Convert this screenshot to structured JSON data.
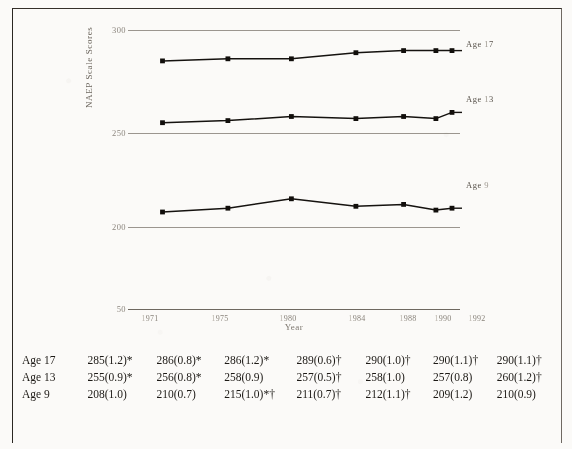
{
  "chart_data": {
    "type": "line",
    "title": "",
    "xlabel": "Year",
    "ylabel": "NAEP Scale Scores",
    "x": [
      "1971",
      "1975",
      "1980",
      "1984",
      "1988",
      "1990",
      "1992"
    ],
    "ylim": [
      50,
      300
    ],
    "yticks": [
      "300",
      "250",
      "200",
      "50"
    ],
    "grid": true,
    "legend_position": "right-inline",
    "series": [
      {
        "name": "Age 17",
        "values": [
          285,
          286,
          286,
          289,
          290,
          290,
          290
        ]
      },
      {
        "name": "Age 13",
        "values": [
          255,
          256,
          258,
          257,
          258,
          257,
          260
        ]
      },
      {
        "name": "Age 9",
        "values": [
          208,
          210,
          215,
          211,
          212,
          209,
          210
        ]
      }
    ]
  },
  "axis": {
    "y_title": "NAEP Scale Scores",
    "x_title": "Year",
    "y_ticks": [
      "300",
      "250",
      "200",
      "50"
    ],
    "x_ticks": [
      "1971",
      "1975",
      "1980",
      "1984",
      "1988",
      "1990",
      "1992"
    ]
  },
  "series_labels": [
    {
      "name": "Age 17",
      "prefix": "Age",
      "value": "17"
    },
    {
      "name": "Age 13",
      "prefix": "Age",
      "value": "13"
    },
    {
      "name": "Age 9",
      "prefix": "Age",
      "value": "9"
    }
  ],
  "table": {
    "rows": [
      {
        "label": "Age 17",
        "values": [
          "285(1.2)*",
          "286(0.8)*",
          "286(1.2)*",
          "289(0.6)†",
          "290(1.0)†",
          "290(1.1)†",
          "290(1.1)†"
        ]
      },
      {
        "label": "Age 13",
        "values": [
          "255(0.9)*",
          "256(0.8)*",
          "258(0.9)",
          "257(0.5)†",
          "258(1.0)",
          "257(0.8)",
          "260(1.2)†"
        ]
      },
      {
        "label": "Age 9",
        "values": [
          "208(1.0)",
          "210(0.7)",
          "215(1.0)*†",
          "211(0.7)†",
          "212(1.1)†",
          "209(1.2)",
          "210(0.9)"
        ]
      }
    ]
  },
  "caption": ""
}
